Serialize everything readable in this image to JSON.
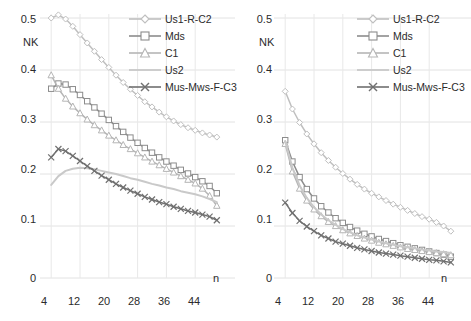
{
  "figure": {
    "panels": [
      {
        "id": "left",
        "ylabel": "NK",
        "xlabel": "n"
      },
      {
        "id": "right",
        "ylabel": "NK",
        "xlabel": "n"
      }
    ],
    "legend_labels": [
      "Us1-R-C2",
      "Mds",
      "C1",
      "Us2",
      "Mus-Mws-F-C3"
    ],
    "legend_markers": [
      "diamond",
      "square",
      "triangle",
      "none",
      "cross"
    ],
    "series_colors": [
      "#bfbfbf",
      "#8c8c8c",
      "#b5b5b5",
      "#c9c9c9",
      "#707070"
    ]
  },
  "chart_data": [
    {
      "type": "line",
      "panel": "left",
      "title": "",
      "xlabel": "n",
      "ylabel": "NK",
      "xlim": [
        2,
        52
      ],
      "ylim": [
        0,
        0.5
      ],
      "xticks": [
        4,
        12,
        20,
        28,
        36,
        44
      ],
      "yticks": [
        0,
        0.1,
        0.2,
        0.3,
        0.4,
        0.5
      ],
      "grid": true,
      "legend_position": "top-right",
      "x": [
        4,
        6,
        8,
        10,
        12,
        14,
        16,
        18,
        20,
        22,
        24,
        26,
        28,
        30,
        32,
        34,
        36,
        38,
        40,
        42,
        44,
        46,
        48,
        50
      ],
      "series": [
        {
          "name": "Us1-R-C2",
          "marker": "diamond",
          "color": "#bfbfbf",
          "values": [
            0.5,
            0.506,
            0.498,
            0.484,
            0.468,
            0.452,
            0.436,
            0.42,
            0.405,
            0.39,
            0.376,
            0.363,
            0.351,
            0.339,
            0.329,
            0.319,
            0.31,
            0.302,
            0.295,
            0.289,
            0.284,
            0.279,
            0.275,
            0.271
          ]
        },
        {
          "name": "Mds",
          "marker": "square",
          "color": "#8c8c8c",
          "values": [
            0.364,
            0.374,
            0.372,
            0.363,
            0.352,
            0.34,
            0.328,
            0.316,
            0.304,
            0.292,
            0.281,
            0.27,
            0.26,
            0.25,
            0.241,
            0.232,
            0.224,
            0.216,
            0.208,
            0.201,
            0.194,
            0.186,
            0.177,
            0.163
          ]
        },
        {
          "name": "C1",
          "marker": "triangle",
          "color": "#b5b5b5",
          "values": [
            0.39,
            0.364,
            0.345,
            0.33,
            0.317,
            0.305,
            0.294,
            0.284,
            0.274,
            0.265,
            0.256,
            0.248,
            0.24,
            0.232,
            0.224,
            0.217,
            0.21,
            0.203,
            0.196,
            0.189,
            0.182,
            0.172,
            0.158,
            0.139
          ]
        },
        {
          "name": "Us2",
          "marker": "none",
          "color": "#c9c9c9",
          "values": [
            0.179,
            0.196,
            0.206,
            0.21,
            0.212,
            0.211,
            0.209,
            0.206,
            0.203,
            0.2,
            0.196,
            0.192,
            0.189,
            0.185,
            0.181,
            0.178,
            0.174,
            0.171,
            0.167,
            0.164,
            0.161,
            0.157,
            0.152,
            0.146
          ]
        },
        {
          "name": "Mus-Mws-F-C3",
          "marker": "cross",
          "color": "#707070",
          "values": [
            0.232,
            0.248,
            0.244,
            0.235,
            0.225,
            0.215,
            0.206,
            0.197,
            0.189,
            0.181,
            0.174,
            0.168,
            0.162,
            0.156,
            0.151,
            0.146,
            0.142,
            0.137,
            0.133,
            0.129,
            0.126,
            0.122,
            0.118,
            0.111
          ]
        }
      ]
    },
    {
      "type": "line",
      "panel": "right",
      "title": "",
      "xlabel": "n",
      "ylabel": "NK",
      "xlim": [
        2,
        52
      ],
      "ylim": [
        0,
        0.5
      ],
      "xticks": [
        4,
        12,
        20,
        28,
        36,
        44
      ],
      "yticks": [
        0,
        0.1,
        0.2,
        0.3,
        0.4,
        0.5
      ],
      "grid": true,
      "legend_position": "top-right",
      "x": [
        4,
        6,
        8,
        10,
        12,
        14,
        16,
        18,
        20,
        22,
        24,
        26,
        28,
        30,
        32,
        34,
        36,
        38,
        40,
        42,
        44,
        46,
        48,
        50
      ],
      "series": [
        {
          "name": "Us1-R-C2",
          "marker": "diamond",
          "color": "#bfbfbf",
          "values": [
            0.359,
            0.325,
            0.299,
            0.277,
            0.258,
            0.241,
            0.226,
            0.213,
            0.201,
            0.19,
            0.18,
            0.171,
            0.163,
            0.156,
            0.149,
            0.142,
            0.136,
            0.13,
            0.124,
            0.118,
            0.113,
            0.107,
            0.1,
            0.09
          ]
        },
        {
          "name": "Mds",
          "marker": "square",
          "color": "#8c8c8c",
          "values": [
            0.265,
            0.224,
            0.194,
            0.171,
            0.153,
            0.138,
            0.126,
            0.115,
            0.106,
            0.098,
            0.091,
            0.085,
            0.08,
            0.075,
            0.071,
            0.067,
            0.063,
            0.06,
            0.057,
            0.054,
            0.051,
            0.048,
            0.045,
            0.041
          ]
        },
        {
          "name": "C1",
          "marker": "triangle",
          "color": "#b5b5b5",
          "values": [
            0.258,
            0.205,
            0.172,
            0.149,
            0.132,
            0.119,
            0.108,
            0.1,
            0.092,
            0.086,
            0.081,
            0.076,
            0.072,
            0.068,
            0.065,
            0.062,
            0.059,
            0.056,
            0.054,
            0.052,
            0.05,
            0.048,
            0.046,
            0.044
          ]
        },
        {
          "name": "Us2",
          "marker": "none",
          "color": "#c9c9c9",
          "values": [
            0.263,
            0.212,
            0.178,
            0.154,
            0.136,
            0.122,
            0.111,
            0.102,
            0.094,
            0.088,
            0.082,
            0.078,
            0.074,
            0.07,
            0.067,
            0.064,
            0.061,
            0.059,
            0.057,
            0.055,
            0.053,
            0.051,
            0.05,
            0.048
          ]
        },
        {
          "name": "Mus-Mws-F-C3",
          "marker": "cross",
          "color": "#707070",
          "values": [
            0.145,
            0.125,
            0.11,
            0.099,
            0.09,
            0.082,
            0.076,
            0.07,
            0.066,
            0.062,
            0.058,
            0.055,
            0.052,
            0.049,
            0.047,
            0.045,
            0.043,
            0.041,
            0.039,
            0.037,
            0.035,
            0.034,
            0.032,
            0.03
          ]
        }
      ]
    }
  ],
  "left_panel": {
    "yticks": [
      "0.5",
      "0.4",
      "0.3",
      "0.2",
      "0.1",
      "0"
    ],
    "xticks": [
      "4",
      "12",
      "20",
      "28",
      "36",
      "44"
    ],
    "ylabel": "NK",
    "xlabel": "n"
  },
  "right_panel": {
    "yticks": [
      "0.5",
      "0.4",
      "0.3",
      "0.2",
      "0.1",
      "0"
    ],
    "xticks": [
      "4",
      "12",
      "20",
      "28",
      "36",
      "44"
    ],
    "ylabel": "NK",
    "xlabel": "n"
  },
  "legend": {
    "items": [
      {
        "label": "Us1-R-C2"
      },
      {
        "label": "Mds"
      },
      {
        "label": "C1"
      },
      {
        "label": "Us2"
      },
      {
        "label": "Mus-Mws-F-C3"
      }
    ]
  }
}
